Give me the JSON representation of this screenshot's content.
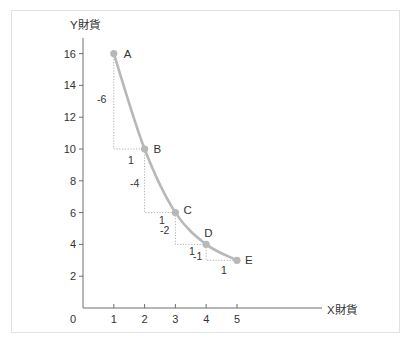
{
  "chart_data": {
    "type": "line",
    "title": "",
    "xlabel": "X財貨",
    "ylabel": "Y財貨",
    "xlim": [
      0,
      5
    ],
    "ylim": [
      0,
      16
    ],
    "x_ticks": [
      "0",
      "1",
      "2",
      "3",
      "4",
      "5"
    ],
    "y_ticks": [
      "2",
      "4",
      "6",
      "8",
      "10",
      "12",
      "14",
      "16"
    ],
    "grid": false,
    "legend": null,
    "series": [
      {
        "name": "indifference-curve",
        "points": [
          {
            "label": "A",
            "x": 1,
            "y": 16
          },
          {
            "label": "B",
            "x": 2,
            "y": 10
          },
          {
            "label": "C",
            "x": 3,
            "y": 6
          },
          {
            "label": "D",
            "x": 4,
            "y": 4
          },
          {
            "label": "E",
            "x": 5,
            "y": 3
          }
        ]
      }
    ],
    "annotations": [
      {
        "segment": "A-B",
        "dx_label": "1",
        "dy_label": "-6"
      },
      {
        "segment": "B-C",
        "dx_label": "1",
        "dy_label": "-4"
      },
      {
        "segment": "C-D",
        "dx_label": "1",
        "dy_label": "-2"
      },
      {
        "segment": "D-E",
        "dx_label": "1",
        "dy_label": "-1"
      }
    ],
    "colors": {
      "curve": "#b8b8b8",
      "points": "#b8b8b8",
      "guides": "#9a9a9a",
      "axis": "#6e6e6e",
      "text": "#333333"
    }
  }
}
